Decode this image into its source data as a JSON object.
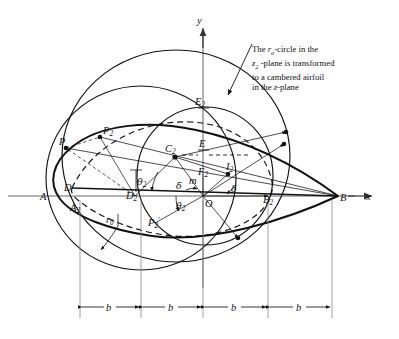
{
  "figure": {
    "caption": {
      "line1_pre": "The ",
      "line1_sym": "r",
      "line1_sub": "o",
      "line1_post": "-circle in the",
      "line2_sym": "z",
      "line2_sub": "2",
      "line2_post": " -plane is transformed",
      "line3": "to a cambered airfoil",
      "line4_pre": "in the ",
      "line4_sym": "z",
      "line4_post": "-plane"
    },
    "axes": {
      "x_label": "x",
      "y_label": "y"
    },
    "points": [
      {
        "id": "A",
        "label": "A",
        "sub": "",
        "x": 45,
        "y": 196
      },
      {
        "id": "B",
        "label": "B",
        "sub": "",
        "x": 338,
        "y": 196
      },
      {
        "id": "D",
        "label": "D",
        "sub": "",
        "x": 72,
        "y": 188
      },
      {
        "id": "D2",
        "label": "D",
        "sub": "2",
        "x": 135,
        "y": 196
      },
      {
        "id": "A2",
        "label": "A",
        "sub": "2",
        "x": 78,
        "y": 205
      },
      {
        "id": "B2",
        "label": "B",
        "sub": "2",
        "x": 272,
        "y": 198
      },
      {
        "id": "C2",
        "label": "C",
        "sub": "2",
        "x": 175,
        "y": 155
      },
      {
        "id": "E",
        "label": "E",
        "sub": "",
        "x": 203,
        "y": 150
      },
      {
        "id": "E2",
        "label": "E",
        "sub": "2",
        "x": 203,
        "y": 108
      },
      {
        "id": "F2",
        "label": "F",
        "sub": "2",
        "x": 203,
        "y": 172
      },
      {
        "id": "I2",
        "label": "I",
        "sub": "2",
        "x": 228,
        "y": 172
      },
      {
        "id": "O",
        "label": "O",
        "sub": "",
        "x": 203,
        "y": 196
      },
      {
        "id": "P",
        "label": "P",
        "sub": "",
        "x": 66,
        "y": 148
      },
      {
        "id": "P2",
        "label": "P",
        "sub": "2",
        "x": 100,
        "y": 137
      },
      {
        "id": "P2p",
        "label": "P",
        "sub": "2",
        "prime": true,
        "x": 155,
        "y": 221
      },
      {
        "id": "m",
        "label": "m",
        "sub": "",
        "x": 193,
        "y": 180
      }
    ],
    "angle_labels": [
      {
        "id": "theta2-upper",
        "glyph": "θ",
        "sub": "2",
        "x": 141,
        "y": 182
      },
      {
        "id": "theta2-lower",
        "glyph": "θ",
        "sub": "2",
        "x": 180,
        "y": 206
      },
      {
        "id": "delta-left",
        "glyph": "δ",
        "sub": "",
        "x": 180,
        "y": 186
      },
      {
        "id": "delta-right",
        "glyph": "δ",
        "sub": "",
        "x": 232,
        "y": 190
      }
    ],
    "radius_label": {
      "glyph": "r",
      "sub": "0",
      "x": 111,
      "y": 220
    },
    "dimensions": {
      "label": "b",
      "count": 4,
      "ticks": [
        80,
        141,
        203,
        268,
        332
      ],
      "baseline_y": 307,
      "labels": [
        "b",
        "b",
        "b",
        "b"
      ]
    },
    "colors": {
      "ink": "#111111",
      "axis": "#555555",
      "page": "#ffffff"
    }
  }
}
